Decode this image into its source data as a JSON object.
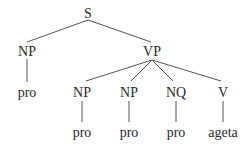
{
  "tree": {
    "nodes": {
      "s": {
        "label": "S",
        "x": 88,
        "y": 14
      },
      "np_subj": {
        "label": "NP",
        "x": 27,
        "y": 52
      },
      "vp": {
        "label": "VP",
        "x": 152,
        "y": 52
      },
      "pro_subj": {
        "label": "pro",
        "x": 27,
        "y": 93
      },
      "np_1": {
        "label": "NP",
        "x": 82,
        "y": 93
      },
      "np_2": {
        "label": "NP",
        "x": 129,
        "y": 93
      },
      "nq": {
        "label": "NQ",
        "x": 176,
        "y": 93
      },
      "v": {
        "label": "V",
        "x": 223,
        "y": 93
      },
      "pro_1": {
        "label": "pro",
        "x": 82,
        "y": 133
      },
      "pro_2": {
        "label": "pro",
        "x": 129,
        "y": 133
      },
      "pro_3": {
        "label": "pro",
        "x": 176,
        "y": 133
      },
      "verb": {
        "label": "ageta",
        "x": 223,
        "y": 133
      }
    }
  }
}
